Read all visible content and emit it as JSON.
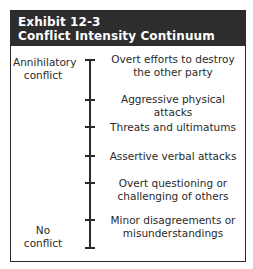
{
  "exhibit": {
    "number": "Exhibit 12-3",
    "title": "Conflict Intensity Continuum",
    "colors": {
      "header_bg": "#2d2d2d",
      "header_text": "#ffffff",
      "line": "#2a2a2a"
    },
    "axis": {
      "top_label_line1": "Annihilatory",
      "top_label_line2": "conflict",
      "bottom_label_line1": "No",
      "bottom_label_line2": "conflict"
    },
    "levels": [
      {
        "line1": "Overt efforts to destroy",
        "line2": "the other party"
      },
      {
        "line1": "Aggressive physical attacks",
        "line2": ""
      },
      {
        "line1": "Threats and ultimatums",
        "line2": ""
      },
      {
        "line1": "Assertive verbal attacks",
        "line2": ""
      },
      {
        "line1": "Overt questioning or",
        "line2": "challenging of others"
      },
      {
        "line1": "Minor disagreements or",
        "line2": "misunderstandings"
      }
    ]
  }
}
